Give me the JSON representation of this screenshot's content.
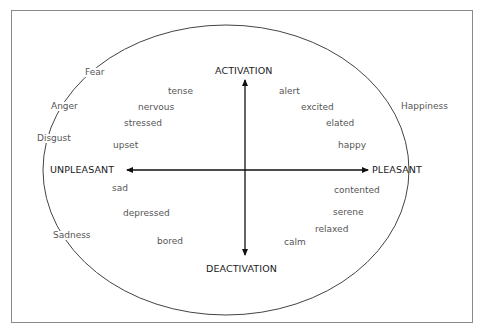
{
  "diagram": {
    "type": "circumplex-model-of-affect",
    "axes": {
      "top": "ACTIVATION",
      "bottom": "DEACTIVATION",
      "left": "UNPLEASANT",
      "right": "PLEASANT"
    },
    "emotions_on_ellipse": [
      "Fear",
      "Anger",
      "Disgust",
      "Sadness",
      "Happiness"
    ],
    "affect_words": {
      "activated_unpleasant": [
        "tense",
        "nervous",
        "stressed",
        "upset"
      ],
      "activated_pleasant": [
        "alert",
        "excited",
        "elated",
        "happy"
      ],
      "deactivated_unpleasant": [
        "sad",
        "depressed",
        "bored"
      ],
      "deactivated_pleasant": [
        "contented",
        "serene",
        "relaxed",
        "calm"
      ]
    },
    "colors": {
      "axis_text": "#1a1a1a",
      "word_text": "#555555",
      "lines": "#333333",
      "frame": "#8a8a8a"
    }
  }
}
